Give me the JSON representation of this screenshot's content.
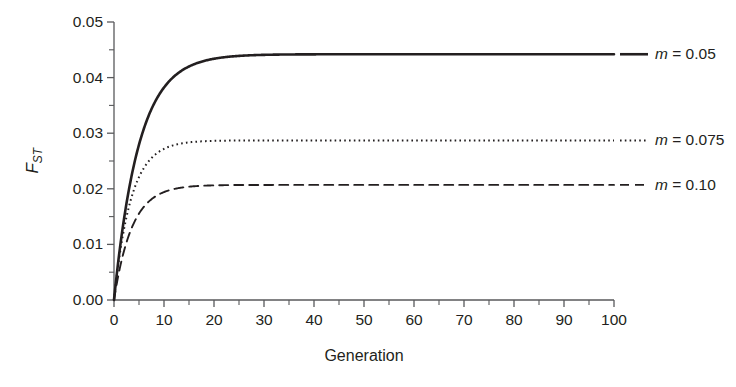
{
  "chart_data": {
    "type": "line",
    "title": "",
    "subtitle": "",
    "xlabel": "Generation",
    "ylabel": "F_ST",
    "ylabel_base": "F",
    "ylabel_sub": "ST",
    "xlim": [
      0,
      100
    ],
    "ylim": [
      0,
      0.05
    ],
    "grid": false,
    "legend_position": "right-of-plot-inline",
    "x_ticks": [
      0,
      10,
      20,
      30,
      40,
      50,
      60,
      70,
      80,
      90,
      100
    ],
    "x_tick_labels": [
      "0",
      "10",
      "20",
      "30",
      "40",
      "50",
      "60",
      "70",
      "80",
      "90",
      "100"
    ],
    "x_minor_ticks": [
      5,
      15,
      25,
      35,
      45,
      55,
      65,
      75,
      85,
      95
    ],
    "y_ticks": [
      0.0,
      0.01,
      0.02,
      0.03,
      0.04,
      0.05
    ],
    "y_tick_labels": [
      "0.00",
      "0.01",
      "0.02",
      "0.03",
      "0.04",
      "0.05"
    ],
    "y_minor_ticks": [
      0.005,
      0.015,
      0.025,
      0.035,
      0.045
    ],
    "line_color": "#231f20",
    "axis_color": "#58595b",
    "background": "#ffffff",
    "x": [
      0,
      1,
      2,
      3,
      4,
      5,
      6,
      7,
      8,
      9,
      10,
      12,
      14,
      16,
      18,
      20,
      25,
      30,
      35,
      40,
      45,
      50,
      60,
      70,
      80,
      90,
      100
    ],
    "series": [
      {
        "name": "m = 0.05",
        "label_m": "m",
        "label_rest": " = 0.05",
        "style": "solid",
        "asymptote": 0.0442,
        "tau": 5.0,
        "values": [
          0.0,
          0.008,
          0.0146,
          0.0201,
          0.0246,
          0.0279,
          0.0309,
          0.0333,
          0.0353,
          0.0369,
          0.0382,
          0.0402,
          0.0415,
          0.0424,
          0.043,
          0.0434,
          0.0439,
          0.0441,
          0.0442,
          0.0442,
          0.0442,
          0.0442,
          0.0442,
          0.0442,
          0.0442,
          0.0442,
          0.0442
        ]
      },
      {
        "name": "m = 0.075",
        "label_m": "m",
        "label_rest": " = 0.075",
        "style": "dotted",
        "asymptote": 0.0287,
        "tau": 3.4,
        "values": [
          0.0,
          0.0074,
          0.013,
          0.0172,
          0.0203,
          0.0226,
          0.0243,
          0.0256,
          0.0265,
          0.0272,
          0.0276,
          0.0282,
          0.0284,
          0.0286,
          0.0287,
          0.0287,
          0.0287,
          0.0287,
          0.0287,
          0.0287,
          0.0287,
          0.0287,
          0.0287,
          0.0287,
          0.0287,
          0.0287,
          0.0287
        ]
      },
      {
        "name": "m = 0.10",
        "label_m": "m",
        "label_rest": " = 0.10",
        "style": "dashed",
        "asymptote": 0.0207,
        "tau": 3.6,
        "values": [
          0.0,
          0.0051,
          0.0094,
          0.0125,
          0.0149,
          0.0168,
          0.0182,
          0.0192,
          0.0198,
          0.0201,
          0.0203,
          0.0205,
          0.0206,
          0.0207,
          0.0207,
          0.0207,
          0.0207,
          0.0207,
          0.0207,
          0.0207,
          0.0207,
          0.0207,
          0.0207,
          0.0207,
          0.0207,
          0.0207,
          0.0207
        ]
      }
    ]
  }
}
